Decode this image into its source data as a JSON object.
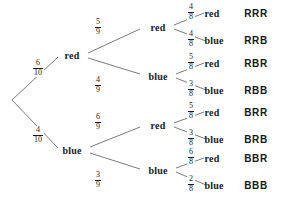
{
  "diagram": {
    "type": "probability-tree",
    "stages": 3,
    "line_color": "#6b6b6b",
    "text_color": "#1a1a1a"
  },
  "nodes": {
    "root": {
      "label": "",
      "x": 10,
      "y": 100
    },
    "level1": [
      {
        "id": "r",
        "label": "red",
        "x": 72,
        "y": 55
      },
      {
        "id": "b",
        "label": "blue",
        "x": 72,
        "y": 150
      }
    ],
    "level2": [
      {
        "id": "rr",
        "label": "red",
        "x": 158,
        "y": 27
      },
      {
        "id": "rb",
        "label": "blue",
        "x": 158,
        "y": 76
      },
      {
        "id": "br",
        "label": "red",
        "x": 158,
        "y": 125
      },
      {
        "id": "bb",
        "label": "blue",
        "x": 158,
        "y": 170
      }
    ],
    "level3": [
      {
        "id": "rrr",
        "label": "red",
        "x": 212,
        "y": 13
      },
      {
        "id": "rrb",
        "label": "blue",
        "x": 214,
        "y": 40
      },
      {
        "id": "rbr",
        "label": "red",
        "x": 212,
        "y": 63
      },
      {
        "id": "rbb",
        "label": "blue",
        "x": 214,
        "y": 90
      },
      {
        "id": "brr",
        "label": "red",
        "x": 212,
        "y": 112
      },
      {
        "id": "brb",
        "label": "blue",
        "x": 214,
        "y": 139
      },
      {
        "id": "bbr",
        "label": "red",
        "x": 212,
        "y": 158
      },
      {
        "id": "bbb",
        "label": "blue",
        "x": 214,
        "y": 185
      }
    ]
  },
  "branch_probabilities": {
    "stage1": [
      {
        "from": "root",
        "to": "r",
        "numerator": "6",
        "denominator": "10",
        "x": 38,
        "y": 68
      },
      {
        "from": "root",
        "to": "b",
        "numerator": "4",
        "denominator": "10",
        "x": 38,
        "y": 135
      }
    ],
    "stage2": [
      {
        "from": "r",
        "to": "rr",
        "numerator": "5",
        "denominator": "9",
        "x": 98,
        "y": 27
      },
      {
        "from": "r",
        "to": "rb",
        "numerator": "4",
        "denominator": "9",
        "x": 98,
        "y": 85
      },
      {
        "from": "b",
        "to": "br",
        "numerator": "6",
        "denominator": "9",
        "x": 98,
        "y": 122
      },
      {
        "from": "b",
        "to": "bb",
        "numerator": "3",
        "denominator": "9",
        "x": 98,
        "y": 180
      }
    ],
    "stage3": [
      {
        "from": "rr",
        "to": "rrr",
        "numerator": "4",
        "denominator": "8",
        "x": 191,
        "y": 12
      },
      {
        "from": "rr",
        "to": "rrb",
        "numerator": "4",
        "denominator": "8",
        "x": 191,
        "y": 39
      },
      {
        "from": "rb",
        "to": "rbr",
        "numerator": "5",
        "denominator": "8",
        "x": 191,
        "y": 62
      },
      {
        "from": "rb",
        "to": "rbb",
        "numerator": "3",
        "denominator": "8",
        "x": 191,
        "y": 89
      },
      {
        "from": "br",
        "to": "brr",
        "numerator": "5",
        "denominator": "8",
        "x": 191,
        "y": 111
      },
      {
        "from": "br",
        "to": "brb",
        "numerator": "3",
        "denominator": "8",
        "x": 191,
        "y": 138
      },
      {
        "from": "bb",
        "to": "bbr",
        "numerator": "6",
        "denominator": "8",
        "x": 191,
        "y": 157
      },
      {
        "from": "bb",
        "to": "bbb",
        "numerator": "2",
        "denominator": "8",
        "x": 191,
        "y": 184
      }
    ]
  },
  "outcomes": [
    {
      "code": "RRR",
      "x": 256,
      "y": 13
    },
    {
      "code": "RRB",
      "x": 256,
      "y": 40
    },
    {
      "code": "RBR",
      "x": 256,
      "y": 63
    },
    {
      "code": "RBB",
      "x": 256,
      "y": 90
    },
    {
      "code": "BRR",
      "x": 256,
      "y": 112
    },
    {
      "code": "BRB",
      "x": 256,
      "y": 139
    },
    {
      "code": "BBR",
      "x": 256,
      "y": 158
    },
    {
      "code": "BBB",
      "x": 256,
      "y": 185
    }
  ],
  "edges": [
    {
      "x1": 12,
      "y1": 100,
      "x2": 58,
      "y2": 57
    },
    {
      "x1": 12,
      "y1": 100,
      "x2": 58,
      "y2": 148
    },
    {
      "x1": 88,
      "y1": 53,
      "x2": 140,
      "y2": 29
    },
    {
      "x1": 88,
      "y1": 58,
      "x2": 140,
      "y2": 74
    },
    {
      "x1": 90,
      "y1": 147,
      "x2": 140,
      "y2": 127
    },
    {
      "x1": 90,
      "y1": 153,
      "x2": 140,
      "y2": 169
    },
    {
      "x1": 174,
      "y1": 25,
      "x2": 204,
      "y2": 13
    },
    {
      "x1": 174,
      "y1": 29,
      "x2": 206,
      "y2": 41
    },
    {
      "x1": 176,
      "y1": 74,
      "x2": 204,
      "y2": 63
    },
    {
      "x1": 176,
      "y1": 78,
      "x2": 206,
      "y2": 90
    },
    {
      "x1": 174,
      "y1": 123,
      "x2": 204,
      "y2": 112
    },
    {
      "x1": 174,
      "y1": 127,
      "x2": 206,
      "y2": 139
    },
    {
      "x1": 176,
      "y1": 168,
      "x2": 204,
      "y2": 158
    },
    {
      "x1": 176,
      "y1": 172,
      "x2": 206,
      "y2": 185
    }
  ]
}
